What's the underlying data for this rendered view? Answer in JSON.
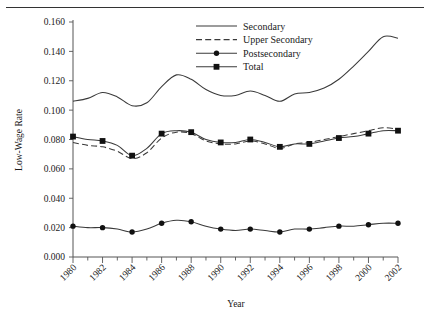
{
  "figure": {
    "has_top_rule": true,
    "axis_color": "#555555",
    "line_color": "#3a3a3a",
    "marker_color": "#111111"
  },
  "chart_data": {
    "type": "line",
    "title": "",
    "xlabel": "Year",
    "ylabel": "Low-Wage Rate",
    "grid": false,
    "legend_position": "top-center",
    "xlim": [
      1980,
      2002
    ],
    "ylim": [
      0.0,
      0.16
    ],
    "x": [
      1980,
      1981,
      1982,
      1983,
      1984,
      1985,
      1986,
      1987,
      1988,
      1989,
      1990,
      1991,
      1992,
      1993,
      1994,
      1995,
      1996,
      1997,
      1998,
      1999,
      2000,
      2001,
      2002
    ],
    "xtick_labels": [
      "1980",
      "1982",
      "1984",
      "1986",
      "1988",
      "1990",
      "1992",
      "1994",
      "1996",
      "1998",
      "2000",
      "2002"
    ],
    "xtick_values": [
      1980,
      1982,
      1984,
      1986,
      1988,
      1990,
      1992,
      1994,
      1996,
      1998,
      2000,
      2002
    ],
    "ytick_labels": [
      "0.000",
      "0.020",
      "0.040",
      "0.060",
      "0.080",
      "0.100",
      "0.120",
      "0.140",
      "0.160"
    ],
    "ytick_values": [
      0.0,
      0.02,
      0.04,
      0.06,
      0.08,
      0.1,
      0.12,
      0.14,
      0.16
    ],
    "series": [
      {
        "name": "Secondary",
        "style": "solid",
        "marker": "none",
        "values": [
          0.106,
          0.108,
          0.112,
          0.109,
          0.103,
          0.105,
          0.116,
          0.124,
          0.121,
          0.114,
          0.11,
          0.11,
          0.113,
          0.11,
          0.106,
          0.111,
          0.112,
          0.115,
          0.121,
          0.13,
          0.14,
          0.15,
          0.149
        ]
      },
      {
        "name": "Upper Secondary",
        "style": "dashed",
        "marker": "none",
        "values": [
          0.078,
          0.076,
          0.075,
          0.072,
          0.067,
          0.071,
          0.081,
          0.085,
          0.084,
          0.079,
          0.077,
          0.077,
          0.079,
          0.077,
          0.074,
          0.077,
          0.078,
          0.08,
          0.082,
          0.084,
          0.086,
          0.088,
          0.087
        ]
      },
      {
        "name": "Postsecondary",
        "style": "solid",
        "marker": "circle",
        "values": [
          0.021,
          0.02,
          0.02,
          0.019,
          0.017,
          0.019,
          0.023,
          0.025,
          0.024,
          0.021,
          0.019,
          0.018,
          0.019,
          0.018,
          0.017,
          0.019,
          0.019,
          0.02,
          0.021,
          0.021,
          0.022,
          0.023,
          0.023
        ]
      },
      {
        "name": "Total",
        "style": "solid",
        "marker": "square",
        "values": [
          0.082,
          0.08,
          0.079,
          0.076,
          0.069,
          0.074,
          0.084,
          0.086,
          0.085,
          0.08,
          0.078,
          0.078,
          0.08,
          0.078,
          0.075,
          0.077,
          0.077,
          0.079,
          0.081,
          0.082,
          0.084,
          0.086,
          0.086
        ]
      }
    ],
    "marked_years": [
      1980,
      1982,
      1984,
      1986,
      1988,
      1990,
      1992,
      1994,
      1996,
      1998,
      2000,
      2002
    ]
  }
}
